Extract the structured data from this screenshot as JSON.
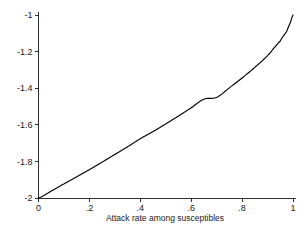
{
  "chart_data": {
    "type": "line",
    "title": "",
    "subtitle": "",
    "xlabel": "Attack rate among susceptibles",
    "ylabel": "",
    "xlim": [
      0,
      1
    ],
    "ylim": [
      -2,
      -1
    ],
    "grid": false,
    "legend": null,
    "background_color": "#ffffff",
    "line_color": "#000000",
    "axis_color": "#1a1a1a",
    "xticks": [
      0,
      0.2,
      0.4,
      0.6,
      0.8,
      1
    ],
    "xticklabels": [
      "0",
      ".2",
      ".4",
      ".6",
      ".8",
      "1"
    ],
    "yticks": [
      -1,
      -1.2,
      -1.4,
      -1.6,
      -1.8,
      -2
    ],
    "yticklabels": [
      "-1",
      "-1.2",
      "-1.4",
      "-1.6",
      "-1.8",
      "-2"
    ],
    "series": [
      {
        "name": "log odds",
        "x": [
          0,
          0.05,
          0.1,
          0.15,
          0.2,
          0.25,
          0.3,
          0.35,
          0.4,
          0.45,
          0.5,
          0.55,
          0.6,
          0.65,
          0.7,
          0.75,
          0.8,
          0.85,
          0.9,
          0.95,
          0.975,
          0.99,
          1
        ],
        "y": [
          -2.0,
          -1.962,
          -1.923,
          -1.884,
          -1.845,
          -1.804,
          -1.762,
          -1.72,
          -1.676,
          -1.637,
          -1.595,
          -1.552,
          -1.507,
          -1.46,
          -1.45,
          -1.398,
          -1.344,
          -1.286,
          -1.222,
          -1.142,
          -1.09,
          -1.04,
          -1.0
        ]
      }
    ]
  },
  "axis_title": {
    "x": "Attack rate among susceptibles"
  }
}
